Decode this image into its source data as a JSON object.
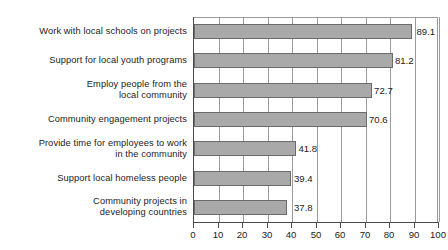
{
  "chart_data": {
    "type": "bar",
    "orientation": "horizontal",
    "title": "",
    "xlabel": "",
    "ylabel": "",
    "xlim": [
      0,
      100
    ],
    "xticks": [
      0,
      10,
      20,
      30,
      40,
      50,
      60,
      70,
      80,
      90,
      100
    ],
    "grid": true,
    "legend": false,
    "bar_color": "#a9a9a9",
    "bar_border_color": "#6b6b6b",
    "axis_color": "#4a4a4a",
    "gridline_color": "#9a9a9a",
    "background": "#ffffff",
    "categories": [
      "Work with local schools on projects",
      "Support for local youth programs",
      "Employ people from the\nlocal community",
      "Community engagement projects",
      "Provide time for employees to work\nin the community",
      "Support local homeless people",
      "Community projects in\ndeveloping countries"
    ],
    "values": [
      89.1,
      81.2,
      72.7,
      70.6,
      41.8,
      39.4,
      37.8
    ],
    "value_labels": [
      "89.1",
      "81.2",
      "72.7",
      "70.6",
      "41.8",
      "39.4",
      "37.8"
    ],
    "tick_labels": [
      "0",
      "10",
      "20",
      "30",
      "40",
      "50",
      "60",
      "70",
      "80",
      "90",
      "100"
    ]
  }
}
